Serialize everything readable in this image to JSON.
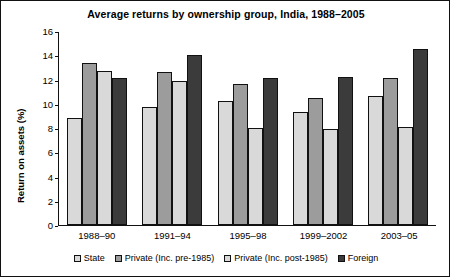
{
  "chart_data": {
    "type": "bar",
    "title": "Average returns by ownership group, India, 1988–2005",
    "xlabel": "",
    "ylabel": "Return on assets (%)",
    "ylim": [
      0,
      16
    ],
    "yticks": [
      0,
      2,
      4,
      6,
      8,
      10,
      12,
      14,
      16
    ],
    "grid": false,
    "legend_position": "bottom",
    "categories": [
      "1988–90",
      "1991–94",
      "1995–98",
      "1999–2002",
      "2003–05"
    ],
    "series": [
      {
        "name": "State",
        "color": "#d9d9d9",
        "values": [
          8.8,
          9.7,
          10.2,
          9.3,
          10.6
        ]
      },
      {
        "name": "Private (Inc. pre-1985)",
        "color": "#9c9c9c",
        "values": [
          13.4,
          12.6,
          11.6,
          10.5,
          12.1
        ]
      },
      {
        "name": "Private (Inc. post-1985)",
        "color": "#d9d9d9",
        "values": [
          12.7,
          11.9,
          8.0,
          7.9,
          8.1
        ]
      },
      {
        "name": "Foreign",
        "color": "#3b3b3b",
        "values": [
          12.1,
          14.0,
          12.1,
          12.2,
          14.5
        ]
      }
    ]
  }
}
